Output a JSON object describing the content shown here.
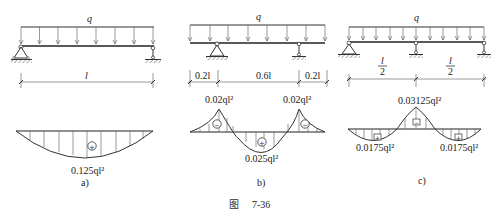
{
  "figure": {
    "caption_prefix": "图",
    "caption_number": "7-36"
  },
  "panels": [
    {
      "id": "a",
      "label": "a)",
      "load_label": "q",
      "spans": [
        {
          "label": "l"
        }
      ],
      "moment_labels": [
        {
          "text": "0.125ql²",
          "sign": "+"
        }
      ]
    },
    {
      "id": "b",
      "label": "b)",
      "load_label": "q",
      "spans": [
        {
          "label": "0.2l"
        },
        {
          "label": "0.6l"
        },
        {
          "label": "0.2l"
        }
      ],
      "moment_labels": [
        {
          "text": "0.02ql²",
          "sign": "−"
        },
        {
          "text": "0.02ql²",
          "sign": "−"
        },
        {
          "text": "0.025ql²",
          "sign": "+"
        }
      ]
    },
    {
      "id": "c",
      "label": "c)",
      "load_label": "q",
      "spans": [
        {
          "label_num": "l",
          "label_den": "2"
        },
        {
          "label_num": "l",
          "label_den": "2"
        }
      ],
      "moment_labels": [
        {
          "text": "0.03125ql²",
          "sign": "−"
        },
        {
          "text": "0.0175ql²",
          "sign": "+"
        },
        {
          "text": "0.0175ql²",
          "sign": "+"
        }
      ]
    }
  ],
  "signs": {
    "plus": "+",
    "minus": "−"
  }
}
